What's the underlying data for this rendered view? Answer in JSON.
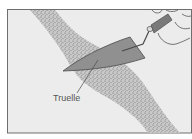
{
  "figure": {
    "title": "Truelle",
    "colors": {
      "background": "#ebebeb",
      "frame": "#6e6e6e",
      "mortar": "#a8a8a8",
      "blade": "#8f8f8f",
      "handle": "#7a7a7a",
      "outline": "#555555"
    },
    "labels": [
      {
        "text": "Truelle",
        "target": "trowel-blade"
      }
    ]
  }
}
